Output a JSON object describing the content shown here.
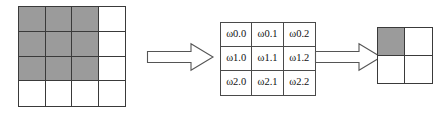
{
  "figure": {
    "colors": {
      "shaded_cell": "#9b9b9b",
      "empty_cell": "#ffffff",
      "grid_line": "#3a3a3a",
      "kernel_grid_line": "#4a4a4a",
      "arrow_stroke": "#555555",
      "arrow_fill": "#ffffff",
      "background": "#ffffff"
    }
  },
  "input_grid": {
    "name": "input-feature-map",
    "rows": 4,
    "cols": 4,
    "cells": [
      [
        {
          "label": "",
          "shaded": true
        },
        {
          "label": "",
          "shaded": true
        },
        {
          "label": "",
          "shaded": true
        },
        {
          "label": "",
          "shaded": false
        }
      ],
      [
        {
          "label": "",
          "shaded": true
        },
        {
          "label": "",
          "shaded": true
        },
        {
          "label": "",
          "shaded": true
        },
        {
          "label": "",
          "shaded": false
        }
      ],
      [
        {
          "label": "",
          "shaded": true
        },
        {
          "label": "",
          "shaded": true
        },
        {
          "label": "",
          "shaded": true
        },
        {
          "label": "",
          "shaded": false
        }
      ],
      [
        {
          "label": "",
          "shaded": false
        },
        {
          "label": "",
          "shaded": false
        },
        {
          "label": "",
          "shaded": false
        },
        {
          "label": "",
          "shaded": false
        }
      ]
    ]
  },
  "kernel_grid": {
    "name": "convolution-kernel",
    "rows": 3,
    "cols": 3,
    "cells": [
      [
        {
          "label": "ω0.0",
          "shaded": false
        },
        {
          "label": "ω0.1",
          "shaded": false
        },
        {
          "label": "ω0.2",
          "shaded": false
        }
      ],
      [
        {
          "label": "ω1.0",
          "shaded": false
        },
        {
          "label": "ω1.1",
          "shaded": false
        },
        {
          "label": "ω1.2",
          "shaded": false
        }
      ],
      [
        {
          "label": "ω2.0",
          "shaded": false
        },
        {
          "label": "ω2.1",
          "shaded": false
        },
        {
          "label": "ω2.2",
          "shaded": false
        }
      ]
    ]
  },
  "output_grid": {
    "name": "output-feature-map",
    "rows": 2,
    "cols": 2,
    "cells": [
      [
        {
          "label": "",
          "shaded": true
        },
        {
          "label": "",
          "shaded": false
        }
      ],
      [
        {
          "label": "",
          "shaded": false
        },
        {
          "label": "",
          "shaded": false
        }
      ]
    ]
  },
  "arrows": [
    {
      "name": "arrow-input-to-kernel",
      "direction": "right",
      "label": ""
    },
    {
      "name": "arrow-kernel-to-output",
      "direction": "right",
      "label": ""
    }
  ]
}
